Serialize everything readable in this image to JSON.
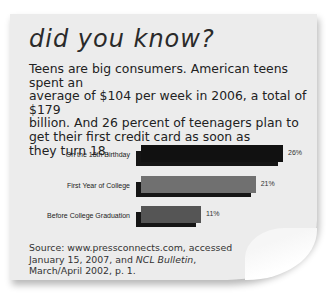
{
  "title": "did you know?",
  "body": "Teens are big consumers. American teens spent an average of $104 per week in 2006, a total of $179 billion. And 26 percent of teenagers plan to get their first credit card as soon as they turn 18.",
  "body_lines": [
    "Teens are big consumers. American teens spent an",
    "average of $104 per week in 2006, a total of $179",
    "billion. And 26 percent of teenagers plan to",
    "get their first credit card as soon as",
    "they turn 18."
  ],
  "source": {
    "prefix": "Source: www.pressconnects.com, accessed January 15, 2007, and ",
    "italic": "NCL Bulletin",
    "suffix": ", March/April 2002, p. 1."
  },
  "colors": {
    "card": "#ececec",
    "bar1": "#111111",
    "bar2": "#707070",
    "bar3": "#555555",
    "shadow": "#151515"
  },
  "chart_data": {
    "type": "bar",
    "orientation": "horizontal",
    "title": "",
    "categories": [
      "On the 18th Birthday",
      "First Year of College",
      "Before College Graduation"
    ],
    "values": [
      26,
      21,
      11
    ],
    "value_labels": [
      "26%",
      "21%",
      "11%"
    ],
    "unit": "%",
    "xlabel": "",
    "ylabel": "",
    "grid": false,
    "legend": false
  }
}
